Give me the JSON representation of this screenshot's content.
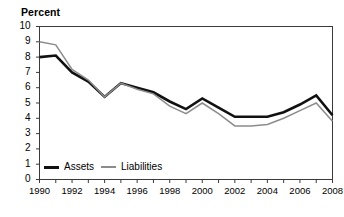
{
  "chart_data": {
    "type": "line",
    "title": "Percent",
    "xlabel": "",
    "ylabel": "Percent",
    "ylim": [
      0,
      10
    ],
    "xlim": [
      1990,
      2008
    ],
    "grid": false,
    "legend_position": "bottom-left",
    "x": [
      1990,
      1991,
      1992,
      1993,
      1994,
      1995,
      1996,
      1997,
      1998,
      1999,
      2000,
      2001,
      2002,
      2003,
      2004,
      2005,
      2006,
      2007,
      2008
    ],
    "xtick_labels": [
      "1990",
      "1992",
      "1994",
      "1996",
      "1998",
      "2000",
      "2002",
      "2004",
      "2006",
      "2008"
    ],
    "xtick_values": [
      1990,
      1992,
      1994,
      1996,
      1998,
      2000,
      2002,
      2004,
      2006,
      2008
    ],
    "ytick_labels": [
      "0",
      "1",
      "2",
      "3",
      "4",
      "5",
      "6",
      "7",
      "8",
      "9",
      "10"
    ],
    "ytick_values": [
      0,
      1,
      2,
      3,
      4,
      5,
      6,
      7,
      8,
      9,
      10
    ],
    "series": [
      {
        "name": "Assets",
        "color": "#111111",
        "line_width": 2.6,
        "values": [
          8.0,
          8.1,
          7.0,
          6.4,
          5.4,
          6.3,
          6.0,
          5.7,
          5.1,
          4.6,
          5.3,
          4.7,
          4.1,
          4.1,
          4.1,
          4.4,
          4.9,
          5.5,
          4.2
        ]
      },
      {
        "name": "Liabilities",
        "color": "#8c8c8c",
        "line_width": 1.5,
        "values": [
          9.0,
          8.8,
          7.2,
          6.5,
          5.4,
          6.3,
          5.9,
          5.6,
          4.8,
          4.3,
          5.0,
          4.3,
          3.5,
          3.5,
          3.6,
          4.0,
          4.5,
          5.0,
          3.8
        ]
      }
    ]
  },
  "legend": {
    "assets_label": "Assets",
    "liabilities_label": "Liabilities"
  },
  "axis_title": "Percent"
}
